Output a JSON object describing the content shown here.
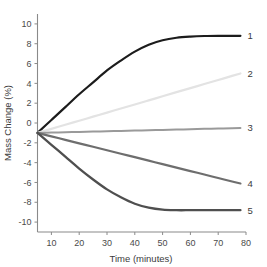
{
  "chart_data": {
    "type": "line",
    "title": "",
    "xlabel": "Time (minutes)",
    "ylabel": "Mass Change (%)",
    "xlim": [
      5,
      80
    ],
    "ylim": [
      -11,
      11
    ],
    "xticks": [
      10,
      20,
      30,
      40,
      50,
      60,
      70,
      80
    ],
    "xtick_labels": [
      "10",
      "20",
      "30",
      "40",
      "50",
      "60",
      "70",
      "80"
    ],
    "yticks": [
      -10,
      -8,
      -6,
      -4,
      -2,
      0,
      2,
      4,
      6,
      8,
      10
    ],
    "ytick_labels": [
      "-10",
      "-8",
      "-6",
      "-4",
      "-2",
      "0",
      "2",
      "4",
      "6",
      "8",
      "10"
    ],
    "grid": false,
    "legend_position": "right-endpoint-labels",
    "x": [
      5,
      10,
      15,
      20,
      25,
      30,
      35,
      40,
      45,
      50,
      55,
      60,
      65,
      70,
      75,
      78
    ],
    "series": [
      {
        "name": "1",
        "label": "1",
        "color": "#1c1c1c",
        "linewidth": 2.2,
        "endpoint_value": 8.8,
        "values": [
          -1.0,
          0.3,
          1.6,
          2.9,
          4.1,
          5.3,
          6.3,
          7.2,
          7.9,
          8.35,
          8.6,
          8.72,
          8.78,
          8.8,
          8.8,
          8.8
        ]
      },
      {
        "name": "2",
        "label": "2",
        "color": "#e3e3e3",
        "linewidth": 2.2,
        "endpoint_value": 5.0,
        "values": [
          -1.0,
          -0.59,
          -0.18,
          0.23,
          0.64,
          1.05,
          1.46,
          1.87,
          2.28,
          2.7,
          3.11,
          3.52,
          3.93,
          4.34,
          4.75,
          5.0
        ]
      },
      {
        "name": "3",
        "label": "3",
        "color": "#9a9a9a",
        "linewidth": 2.0,
        "endpoint_value": -0.5,
        "values": [
          -1.0,
          -0.97,
          -0.93,
          -0.9,
          -0.87,
          -0.83,
          -0.8,
          -0.76,
          -0.73,
          -0.7,
          -0.66,
          -0.63,
          -0.59,
          -0.56,
          -0.52,
          -0.5
        ]
      },
      {
        "name": "4",
        "label": "4",
        "color": "#6e6e6e",
        "linewidth": 2.2,
        "endpoint_value": -6.1,
        "values": [
          -1.0,
          -1.35,
          -1.7,
          -2.05,
          -2.4,
          -2.75,
          -3.1,
          -3.45,
          -3.8,
          -4.15,
          -4.5,
          -4.85,
          -5.2,
          -5.55,
          -5.9,
          -6.1
        ]
      },
      {
        "name": "5",
        "label": "5",
        "color": "#4f4f4f",
        "linewidth": 2.3,
        "endpoint_value": -8.8,
        "values": [
          -1.0,
          -2.2,
          -3.4,
          -4.6,
          -5.7,
          -6.7,
          -7.5,
          -8.15,
          -8.55,
          -8.75,
          -8.8,
          -8.8,
          -8.8,
          -8.8,
          -8.8,
          -8.8
        ]
      }
    ]
  },
  "axis": {
    "x_title": "Time (minutes)",
    "y_title": "Mass Change (%)"
  }
}
